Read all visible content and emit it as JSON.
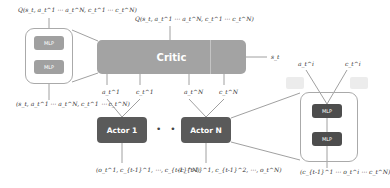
{
  "critic": {
    "label": "Critic",
    "output": "Q(s_t, a_t^1 ⋯ a_t^N, c_t^1 ⋯ c_t^N)",
    "state_input": "s_t",
    "inputs": [
      "a_t^1",
      "c_t^1",
      "a_t^N",
      "c_t^N"
    ],
    "color": "#a3a3a3"
  },
  "critic_detail": {
    "output": "Q(s_t, a_t^1 ⋯ a_t^N, c_t^1 ⋯ c_t^N)",
    "layers": [
      "MLP",
      "MLP"
    ],
    "input": "(s_t, a_t^1 ⋯ a_t^N, c_t^1 ⋯ c_t^N)"
  },
  "actors": [
    {
      "label": "Actor 1",
      "out_a": "a_t^1",
      "out_c": "c_t^1",
      "input": "(o_t^1, c_{t-1}^1, ⋯, c_{t-1}^N)"
    },
    {
      "label": "Actor N",
      "out_a": "a_t^N",
      "out_c": "c_t^N",
      "input": "(c_{t-1}^1, c_{t-1}^2, ⋯, o_t^N)"
    }
  ],
  "ellipsis": "• • •",
  "actor_detail": {
    "outputs": [
      "a_t^i",
      "c_t^i"
    ],
    "layers": [
      "MLP",
      "MLP"
    ],
    "input": "(c_{t-1}^1 ⋯ o_t^i ⋯ c_t^N)",
    "color": "#4d4d4d"
  }
}
